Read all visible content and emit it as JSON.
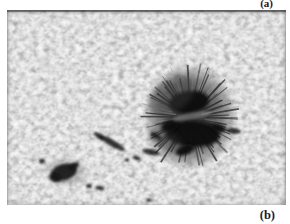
{
  "figure": {
    "panel_top_label": "(a)",
    "panel_bottom_label": "(b)",
    "photo": {
      "width": 279,
      "height": 195,
      "colors": {
        "granule_light": "#c6c6c6",
        "granule_mid": "#9a9a9a",
        "intergranular_dark": "#707070",
        "penumbra": "#474747",
        "umbra": "#0b0b0b",
        "filament_dark": "#2e2e2e",
        "filament_light": "#969696",
        "pore": "#121212",
        "light_bridge": "#8f8f8f",
        "edge_strip": "#4a4a4a"
      },
      "big_spot": {
        "cx": 183,
        "cy": 107,
        "penumbra_rx": 48,
        "penumbra_ry": 54,
        "filaments": {
          "count": 88,
          "seed": 42,
          "inner_r": 15,
          "outer_r_min": 34,
          "outer_r_max": 50
        },
        "umbra_blobs": [
          {
            "cx": 182,
            "cy": 92,
            "rx": 20,
            "ry": 11,
            "rot": -8
          },
          {
            "cx": 186,
            "cy": 124,
            "rx": 27,
            "ry": 13,
            "rot": 3
          },
          {
            "cx": 163,
            "cy": 116,
            "rx": 9,
            "ry": 6,
            "rot": -20
          },
          {
            "cx": 178,
            "cy": 140,
            "rx": 10,
            "ry": 5,
            "rot": -20
          },
          {
            "cx": 211,
            "cy": 118,
            "rx": 8,
            "ry": 4,
            "rot": 15
          }
        ],
        "overlays": [
          {
            "cx": 185,
            "cy": 106,
            "rx": 20,
            "ry": 3.2,
            "rot": -10,
            "color": "#8f8f8f",
            "opacity": 0.55,
            "blur": "b1"
          },
          {
            "cx": 165,
            "cy": 85,
            "rx": 26,
            "ry": 16,
            "rot": -35,
            "color": "#3a3a3a",
            "opacity": 0.45,
            "blur": "b25"
          },
          {
            "cx": 158,
            "cy": 130,
            "rx": 18,
            "ry": 10,
            "rot": 25,
            "color": "#3a3a3a",
            "opacity": 0.35,
            "blur": "b25"
          }
        ]
      },
      "small_spot": {
        "halo": {
          "cx": 59,
          "cy": 162,
          "rx": 19,
          "ry": 13,
          "rot": 0
        },
        "blobs": [
          {
            "cx": 57,
            "cy": 162,
            "rx": 13,
            "ry": 8,
            "rot": -15
          },
          {
            "cx": 48,
            "cy": 168,
            "rx": 6,
            "ry": 4,
            "rot": 20
          },
          {
            "cx": 67,
            "cy": 156,
            "rx": 5,
            "ry": 3,
            "rot": -30
          }
        ]
      },
      "dark_streaks": [
        {
          "cx": 105,
          "cy": 133,
          "rx": 15,
          "ry": 3.2,
          "rot": 30
        },
        {
          "cx": 92,
          "cy": 126,
          "rx": 6,
          "ry": 2.5,
          "rot": 35
        },
        {
          "cx": 144,
          "cy": 142,
          "rx": 9,
          "ry": 3,
          "rot": 12
        },
        {
          "cx": 130,
          "cy": 148,
          "rx": 4,
          "ry": 2,
          "rot": 20
        },
        {
          "cx": 149,
          "cy": 126,
          "rx": 6,
          "ry": 2.5,
          "rot": 30
        },
        {
          "cx": 35,
          "cy": 151,
          "rx": 3,
          "ry": 2.5,
          "rot": 0
        },
        {
          "cx": 82,
          "cy": 176,
          "rx": 3,
          "ry": 2,
          "rot": 0
        },
        {
          "cx": 93,
          "cy": 178,
          "rx": 4.5,
          "ry": 2,
          "rot": 10
        },
        {
          "cx": 120,
          "cy": 150,
          "rx": 2.5,
          "ry": 1.8,
          "rot": 0
        },
        {
          "cx": 227,
          "cy": 121,
          "rx": 7,
          "ry": 3,
          "rot": 5
        },
        {
          "cx": 142,
          "cy": 190,
          "rx": 3,
          "ry": 1.5,
          "rot": 0
        }
      ]
    }
  }
}
